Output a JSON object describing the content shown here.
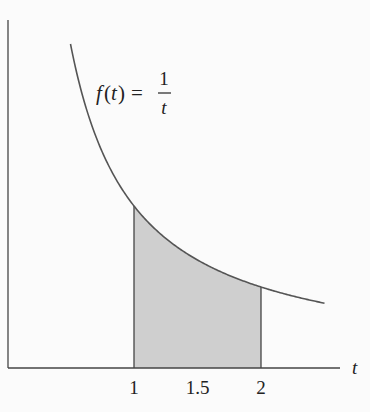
{
  "chart_data": {
    "type": "area",
    "title": "",
    "function_label": {
      "lhs": "f(t) =",
      "numerator": "1",
      "denominator": "t"
    },
    "xlabel": "t",
    "ylabel": "",
    "x_ticks": [
      "1",
      "1.5",
      "2"
    ],
    "x_tick_values": [
      1,
      1.5,
      2
    ],
    "curve": {
      "expression": "1/t",
      "t_range": [
        0.5,
        2.5
      ],
      "color": "#555555"
    },
    "shaded_region": {
      "from": 1,
      "to": 2,
      "fill": "#cfcfcf"
    },
    "xlim": [
      0,
      2.6
    ],
    "ylim": [
      0,
      2.1
    ],
    "grid": false,
    "legend": null
  }
}
